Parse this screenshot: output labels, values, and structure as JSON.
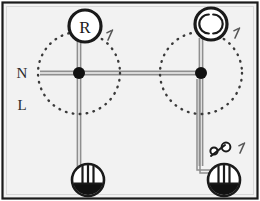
{
  "diagram": {
    "kind": "electrical-installation-wiring-diagram",
    "frame": {
      "border_color": "#1a1a1a",
      "background_color": "#f2f2f2",
      "width": 260,
      "height": 201
    },
    "colors": {
      "wire": "#8f8f8f",
      "wire_dark": "#5a5a5a",
      "symbol_stroke": "#1a1a1a",
      "node_fill": "#111111",
      "dotted_circle": "#3a3a3a",
      "text": "#2b2b2b",
      "lamp_fill": "#111111"
    },
    "bus_labels": [
      {
        "name": "neutral",
        "text": "N",
        "x": 22,
        "y": 78
      },
      {
        "name": "line",
        "text": "L",
        "x": 22,
        "y": 110
      }
    ],
    "devices": [
      {
        "name": "regulator-controller",
        "symbol": "circle-with-letter",
        "letter": "R",
        "x": 85,
        "y": 26,
        "r": 16,
        "wire_marks": 1,
        "mark_label": "/"
      },
      {
        "name": "ventilator-fan",
        "symbol": "circle-with-arcs",
        "letter": "",
        "x": 211,
        "y": 24,
        "r": 16,
        "wire_marks": 1,
        "mark_label": "/"
      },
      {
        "name": "socket-outlet-left",
        "symbol": "socket-outlet",
        "x": 88,
        "y": 180,
        "r": 16
      },
      {
        "name": "socket-outlet-right",
        "symbol": "socket-outlet",
        "x": 224,
        "y": 180,
        "r": 16
      },
      {
        "name": "switch",
        "symbol": "two-pole-switch",
        "x": 222,
        "y": 148,
        "wire_marks": 1,
        "mark_label": "/"
      }
    ],
    "junctions": [
      {
        "name": "junction-left",
        "x": 79,
        "y": 73,
        "r": 6
      },
      {
        "name": "junction-right",
        "x": 201,
        "y": 73,
        "r": 6
      }
    ],
    "coverage_circles": [
      {
        "name": "coverage-area-left",
        "cx": 79,
        "cy": 73,
        "r": 41
      },
      {
        "name": "coverage-area-right",
        "cx": 201,
        "cy": 73,
        "r": 41
      }
    ],
    "wires": [
      {
        "name": "bus-wire-horizontal",
        "from": "left-edge",
        "to": "junction-right"
      },
      {
        "name": "riser-left-to-regulator",
        "from": "junction-left",
        "to": "regulator-controller"
      },
      {
        "name": "drop-left-to-socket",
        "from": "junction-left",
        "to": "socket-outlet-left"
      },
      {
        "name": "riser-right-to-ventilator",
        "from": "junction-right",
        "to": "ventilator-fan"
      },
      {
        "name": "drop-right-to-socket",
        "from": "junction-right",
        "to": "socket-outlet-right"
      },
      {
        "name": "switch-branch-wire",
        "from": "junction-right",
        "to": "socket-outlet-right"
      }
    ]
  }
}
